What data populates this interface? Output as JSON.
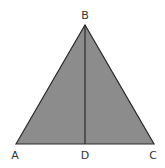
{
  "diagram": {
    "type": "triangle-with-altitude",
    "fill_color": "#8c8c8c",
    "stroke_color": "#2a2a2a",
    "vertices": {
      "A": {
        "label": "A",
        "x": 16,
        "y": 144
      },
      "B": {
        "label": "B",
        "x": 85,
        "y": 25
      },
      "C": {
        "label": "C",
        "x": 154,
        "y": 144
      },
      "D": {
        "label": "D",
        "x": 85,
        "y": 144
      }
    },
    "segments": [
      "AB",
      "BC",
      "CA",
      "BD"
    ]
  }
}
